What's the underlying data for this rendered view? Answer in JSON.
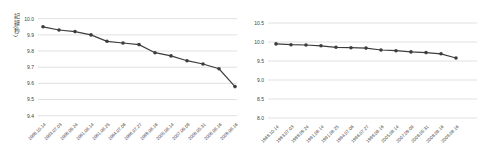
{
  "figure": {
    "background": "#ffffff"
  },
  "chart_data": [
    {
      "type": "line",
      "name": "left-chart-narrow-scale",
      "title": "",
      "xlabel": "",
      "ylabel": "記録(秒)",
      "x": [
        "1968.10.14",
        "1983.07.03",
        "1988.09.24",
        "1991.06.14",
        "1991.08.25",
        "1994.07.06",
        "1996.07.27",
        "1999.06.16",
        "2005.06.14",
        "2007.09.09",
        "2008.05.31",
        "2008.08.16",
        "2009.08.16"
      ],
      "series": [
        {
          "name": "100m-world-record",
          "values": [
            9.95,
            9.93,
            9.92,
            9.9,
            9.86,
            9.85,
            9.84,
            9.79,
            9.77,
            9.74,
            9.72,
            9.69,
            9.58
          ]
        }
      ],
      "ylim": [
        9.4,
        10.0
      ],
      "yticks": [
        "10.0",
        "9.9",
        "9.8",
        "9.7",
        "9.6",
        "9.5",
        "9.4"
      ],
      "grid": true,
      "legend": "none",
      "marker": "circle",
      "line_color": "#3d3d3d",
      "marker_color": "#3d3d3d",
      "grid_color": "#d9d9d9",
      "text_color": "#404040"
    },
    {
      "type": "line",
      "name": "right-chart-wide-scale",
      "title": "",
      "xlabel": "",
      "ylabel": "",
      "x": [
        "1968.10.14",
        "1983.07.03",
        "1988.09.24",
        "1991.06.14",
        "1991.08.25",
        "1994.07.06",
        "1996.07.27",
        "1999.06.16",
        "2005.06.14",
        "2007.09.09",
        "2008.05.31",
        "2008.08.16",
        "2009.08.16"
      ],
      "series": [
        {
          "name": "100m-world-record",
          "values": [
            9.95,
            9.93,
            9.92,
            9.9,
            9.86,
            9.85,
            9.84,
            9.79,
            9.77,
            9.74,
            9.72,
            9.69,
            9.58
          ]
        }
      ],
      "ylim": [
        8.0,
        10.5
      ],
      "yticks": [
        "10.5",
        "10.0",
        "9.5",
        "9.0",
        "8.5",
        "8.0"
      ],
      "grid": true,
      "legend": "none",
      "marker": "circle",
      "line_color": "#3d3d3d",
      "marker_color": "#3d3d3d",
      "grid_color": "#d9d9d9",
      "text_color": "#404040"
    }
  ]
}
